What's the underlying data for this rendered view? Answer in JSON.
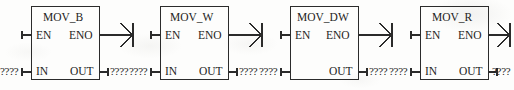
{
  "diagram": {
    "type": "ladder-logic-function-blocks",
    "notation": "IEC 61131-3 LAD",
    "canvas": {
      "width": 514,
      "height": 90
    },
    "stroke_color": "#2b2b2b",
    "text_color": "#1d1d1d",
    "background_color": "#fdfdfc",
    "unassigned_operand": "????",
    "blocks": [
      {
        "id": "mov-b",
        "title": "MOV_B",
        "enable_input_label": "EN",
        "enable_output_label": "ENO",
        "data_input_label": "IN",
        "data_output_label": "OUT",
        "input_operand": "????",
        "output_operand": "????",
        "has_output_coil": true,
        "box": {
          "x": 31,
          "y": 6,
          "width": 69,
          "height": 74
        }
      },
      {
        "id": "mov-w",
        "title": "MOV_W",
        "enable_input_label": "EN",
        "enable_output_label": "ENO",
        "data_input_label": "IN",
        "data_output_label": "OUT",
        "input_operand": "????",
        "output_operand": "????",
        "has_output_coil": true,
        "box": {
          "x": 160,
          "y": 6,
          "width": 69,
          "height": 74
        }
      },
      {
        "id": "mov-dw",
        "title": "MOV_DW",
        "enable_input_label": "EN",
        "enable_output_label": "ENO",
        "data_input_label": "",
        "data_output_label": "OUT",
        "input_operand": "????",
        "output_operand": "????",
        "has_output_coil": true,
        "box": {
          "x": 290,
          "y": 6,
          "width": 69,
          "height": 74
        }
      },
      {
        "id": "mov-r",
        "title": "MOV_R",
        "enable_input_label": "EN",
        "enable_output_label": "ENO",
        "data_input_label": "IN",
        "data_output_label": "OUT",
        "input_operand": "????",
        "output_operand": "????",
        "has_output_coil": true,
        "box": {
          "x": 420,
          "y": 6,
          "width": 69,
          "height": 74
        }
      }
    ]
  }
}
